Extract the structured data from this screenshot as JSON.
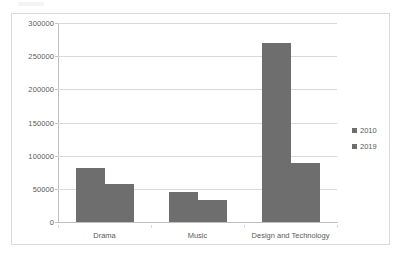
{
  "chart_data": {
    "type": "bar",
    "title": "",
    "subtitle": "",
    "xlabel": "",
    "ylabel": "",
    "categories": [
      "Drama",
      "Music",
      "Design and Technology"
    ],
    "series": [
      {
        "name": "2010",
        "values": [
          81000,
          45000,
          270000
        ],
        "color": "#6e6e6e"
      },
      {
        "name": "2019",
        "values": [
          57000,
          33000,
          89000
        ],
        "color": "#6e6e6e"
      }
    ],
    "ylim": [
      0,
      300000
    ],
    "ytick_labels": [
      "0",
      "50000",
      "100000",
      "150000",
      "200000",
      "250000",
      "300000"
    ],
    "ytick_values": [
      0,
      50000,
      100000,
      150000,
      200000,
      250000,
      300000
    ],
    "grid": true,
    "grid_axis": "y",
    "legend": [
      "2010",
      "2019"
    ],
    "legend_position": "right",
    "bar_gap_within_group": 0,
    "annotations": []
  },
  "legend": {
    "entries": [
      {
        "label": "2010",
        "swatch_name": "legend-swatch-2010"
      },
      {
        "label": "2019",
        "swatch_name": "legend-swatch-2019"
      }
    ]
  },
  "axes": {
    "y_ticks": [
      {
        "label": "300000",
        "value": 300000
      },
      {
        "label": "250000",
        "value": 250000
      },
      {
        "label": "200000",
        "value": 200000
      },
      {
        "label": "150000",
        "value": 150000
      },
      {
        "label": "100000",
        "value": 100000
      },
      {
        "label": "50000",
        "value": 50000
      },
      {
        "label": "0",
        "value": 0
      }
    ],
    "x_categories": [
      "Drama",
      "Music",
      "Design and Technology"
    ]
  },
  "colors": {
    "bar_fill": "#6e6e6e",
    "gridline": "#d9d9d9",
    "axis": "#bfbfbf",
    "text": "#5a5a5a",
    "frame_border": "#d9d9d9",
    "background": "#ffffff"
  }
}
